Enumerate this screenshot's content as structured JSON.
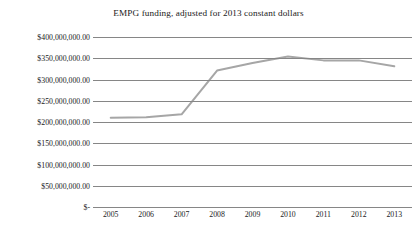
{
  "chart_data": {
    "type": "line",
    "title": "EMPG funding, adjusted for 2013 constant dollars",
    "xlabel": "",
    "ylabel": "",
    "categories": [
      "2005",
      "2006",
      "2007",
      "2008",
      "2009",
      "2010",
      "2011",
      "2012",
      "2013"
    ],
    "series": [
      {
        "name": "EMPG funding",
        "color": "#a6a6a6",
        "values": [
          210000000,
          211000000,
          218000000,
          321000000,
          339000000,
          354000000,
          345000000,
          345000000,
          331000000
        ]
      }
    ],
    "ylim": [
      0,
      400000000
    ],
    "ytick_values": [
      400000000,
      350000000,
      300000000,
      250000000,
      200000000,
      150000000,
      100000000,
      50000000,
      0
    ],
    "ytick_labels": [
      "$400,000,000.00",
      "$350,000,000.00",
      "$300,000,000.00",
      "$250,000,000.00",
      "$200,000,000.00",
      "$150,000,000.00",
      "$100,000,000.00",
      "$50,000,000.00",
      "$-"
    ],
    "grid": true,
    "grid_color": "#868686",
    "legend": false,
    "legend_position": "none",
    "background_color": "#ffffff"
  }
}
